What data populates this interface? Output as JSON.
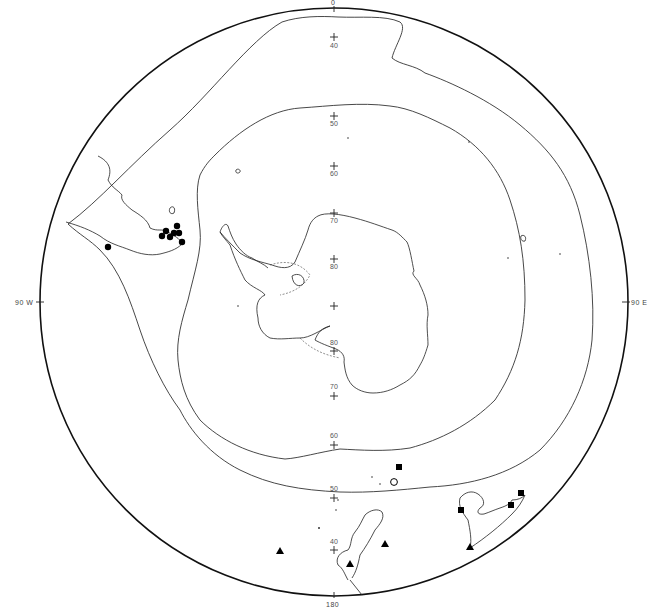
{
  "map": {
    "projection": "south polar stereographic",
    "edge_labels": {
      "top": "0",
      "bottom": "180",
      "left": "90 W",
      "right": "90 E"
    },
    "latitude_labels_upper": [
      "40",
      "50",
      "60",
      "70",
      "80"
    ],
    "latitude_labels_lower": [
      "80",
      "70",
      "60",
      "50",
      "40"
    ],
    "colors": {
      "line": "#222222",
      "background": "#ffffff",
      "marker": "#000000"
    },
    "marker_groups": [
      {
        "name": "solid circles",
        "symbol": "filled-circle",
        "region": "South America (Patagonia)",
        "count": 8
      },
      {
        "name": "solid squares",
        "symbol": "filled-square",
        "region": "southern Australia / Southern Indian Ocean",
        "count": 5
      },
      {
        "name": "solid triangles",
        "symbol": "filled-triangle",
        "region": "New Zealand / Tasman Sea",
        "count": 4
      },
      {
        "name": "open circle",
        "symbol": "open-circle",
        "region": "Southern Indian Ocean",
        "count": 1
      }
    ]
  }
}
